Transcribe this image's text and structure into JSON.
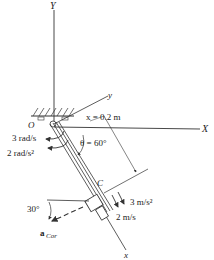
{
  "diagram": {
    "type": "mechanics-kinematics",
    "axes": {
      "fixed_vertical": "Y",
      "fixed_horizontal": "X",
      "rotating_x": "x",
      "rotating_y": "y",
      "origin": "O"
    },
    "labels": {
      "distance": "x = 0.2 m",
      "angle": "θ = 60°",
      "angular_velocity": "3 rad/s",
      "angular_acceleration": "2 rad/s²",
      "collar": "C",
      "collar_acceleration": "3 m/s²",
      "collar_velocity": "2 m/s",
      "coriolis_angle": "30°",
      "coriolis_vector": "a",
      "coriolis_subscript": "Cor"
    },
    "colors": {
      "line": "#333333",
      "text": "#222222",
      "background": "#ffffff"
    }
  }
}
